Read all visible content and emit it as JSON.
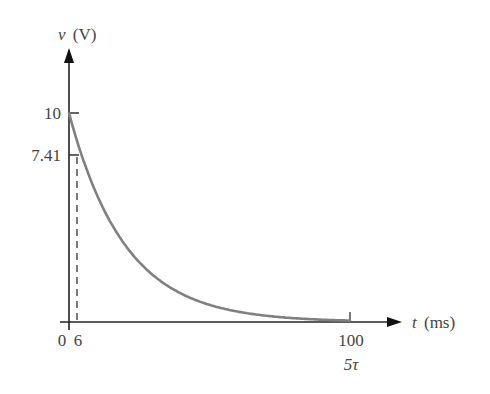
{
  "chart_data": {
    "type": "line",
    "title": "",
    "xlabel": "t (ms)",
    "xlabel_var": "t",
    "xlabel_unit": "(ms)",
    "ylabel": "v (V)",
    "ylabel_var": "v",
    "ylabel_unit": "(V)",
    "xlim": [
      0,
      100
    ],
    "ylim": [
      0,
      10
    ],
    "grid": false,
    "legend": "none",
    "x_ticks": [
      "0",
      "6",
      "100"
    ],
    "x_tick_extra_label": "5τ",
    "y_ticks": [
      "10",
      "7.41"
    ],
    "series": [
      {
        "name": "v(t) = 10 e^(-t/20)",
        "color": "#808080",
        "x": [
          0,
          2,
          4,
          6,
          8,
          10,
          15,
          20,
          25,
          30,
          40,
          50,
          60,
          70,
          80,
          90,
          100
        ],
        "values": [
          10,
          9.05,
          8.19,
          7.41,
          6.7,
          6.07,
          4.72,
          3.68,
          2.87,
          2.23,
          1.35,
          0.82,
          0.5,
          0.3,
          0.18,
          0.11,
          0.07
        ]
      }
    ],
    "annotations": [
      {
        "type": "dashed-vertical",
        "x": 6,
        "from_y": 0,
        "to_y": 7.41
      }
    ],
    "tau_ms": 20
  },
  "labels": {
    "y_var": "v",
    "y_unit": "(V)",
    "x_var": "t",
    "x_unit": "(ms)",
    "y_tick_10": "10",
    "y_tick_741": "7.41",
    "x_tick_0": "0",
    "x_tick_6": "6",
    "x_tick_100": "100",
    "x_tick_5tau": "5τ"
  }
}
